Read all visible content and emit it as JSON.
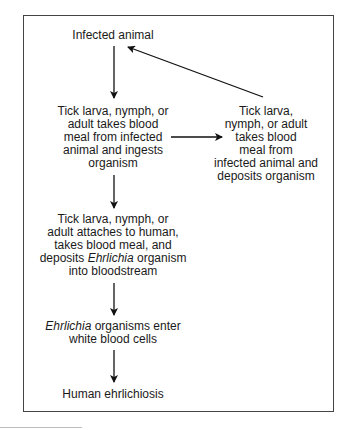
{
  "diagram": {
    "nodes": {
      "infected_animal": {
        "lines": [
          "Infected animal"
        ]
      },
      "tick_ingests": {
        "lines": [
          "Tick larva, nymph, or",
          "adult takes blood",
          "meal from infected",
          "animal and ingests",
          "organism"
        ]
      },
      "tick_deposits": {
        "lines": [
          "Tick larva,",
          "nymph, or adult",
          "takes blood",
          "meal from",
          "infected animal and",
          "deposits organism"
        ]
      },
      "tick_human": {
        "lines": [
          "Tick larva, nymph, or",
          "adult attaches to human,",
          "takes blood meal, and"
        ],
        "line4_prefix": "deposits ",
        "line4_italic": "Ehrlichia",
        "line4_suffix": " organism",
        "line5": "into bloodstream"
      },
      "enter_wbc": {
        "line1_italic": "Ehrlichia",
        "line1_suffix": " organisms enter",
        "line2": "white blood cells"
      },
      "human_disease": {
        "lines": [
          "Human ehrlichiosis"
        ]
      }
    },
    "edges": [
      {
        "from": "infected_animal",
        "to": "tick_ingests"
      },
      {
        "from": "tick_ingests",
        "to": "tick_deposits"
      },
      {
        "from": "tick_deposits",
        "to": "infected_animal"
      },
      {
        "from": "tick_ingests",
        "to": "tick_human"
      },
      {
        "from": "tick_human",
        "to": "enter_wbc"
      },
      {
        "from": "enter_wbc",
        "to": "human_disease"
      }
    ],
    "colors": {
      "text": "#1a1a1a",
      "border": "#444444",
      "arrow": "#111111"
    }
  }
}
